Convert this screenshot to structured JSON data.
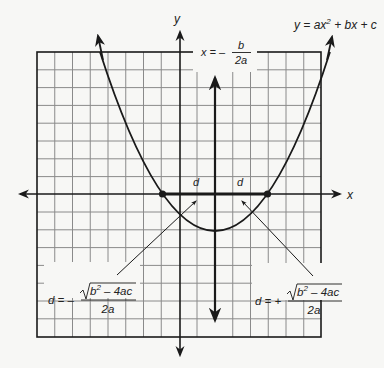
{
  "diagram": {
    "equation_label": {
      "prefix": "y = ax",
      "exp": "2",
      "suffix": " + bx + c"
    },
    "axis_labels": {
      "x": "x",
      "y": "y"
    },
    "symmetry_label": {
      "lhs": "x = –",
      "num": "b",
      "den": "2a"
    },
    "distance_labels": {
      "left": "d",
      "right": "d"
    },
    "formula_left": {
      "lhs": "d = –",
      "num_rad": "b",
      "num_exp": "2",
      "num_rest": " – 4ac",
      "den": "2a"
    },
    "formula_right": {
      "lhs": "d = +",
      "num_rad": "b",
      "num_exp": "2",
      "num_rest": " – 4ac",
      "den": "2a"
    },
    "grid": {
      "columns": 16,
      "rows": 16,
      "left": 37,
      "top": 52,
      "right": 321,
      "bottom": 337
    },
    "colors": {
      "ink": "#1a1a1a",
      "grid": "#8a8a8a",
      "background": "#f7f7f5"
    }
  }
}
